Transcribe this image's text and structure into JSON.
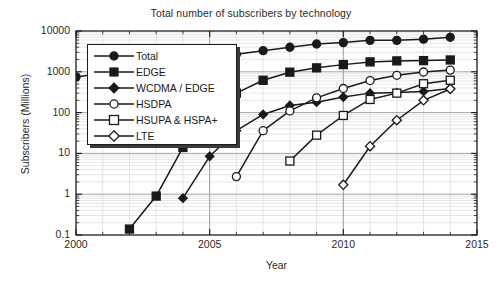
{
  "chart_data": {
    "type": "line",
    "title": "Total number of subscribers by technology",
    "xlabel": "Year",
    "ylabel": "Subscribers (Millions)",
    "xlim": [
      2000,
      2015
    ],
    "ylim": [
      0.1,
      10000
    ],
    "yscale": "log",
    "grid": true,
    "legend_position": "upper left",
    "xticks": [
      "2000",
      "2005",
      "2010",
      "2015"
    ],
    "yticks": [
      "0.1",
      "1",
      "10",
      "100",
      "1000",
      "10000"
    ],
    "series": [
      {
        "name": "Total",
        "marker": "filled-circle",
        "points": [
          {
            "x": 2000,
            "y": 750
          },
          {
            "x": 2006,
            "y": 2700
          },
          {
            "x": 2007,
            "y": 3300
          },
          {
            "x": 2008,
            "y": 4000
          },
          {
            "x": 2009,
            "y": 4800
          },
          {
            "x": 2010,
            "y": 5200
          },
          {
            "x": 2011,
            "y": 5900
          },
          {
            "x": 2012,
            "y": 5900
          },
          {
            "x": 2013,
            "y": 6300
          },
          {
            "x": 2014,
            "y": 7000
          }
        ]
      },
      {
        "name": "EDGE",
        "marker": "filled-square",
        "points": [
          {
            "x": 2002,
            "y": 0.14
          },
          {
            "x": 2003,
            "y": 0.9
          },
          {
            "x": 2004,
            "y": 14
          },
          {
            "x": 2006,
            "y": 300
          },
          {
            "x": 2007,
            "y": 620
          },
          {
            "x": 2008,
            "y": 980
          },
          {
            "x": 2009,
            "y": 1250
          },
          {
            "x": 2010,
            "y": 1500
          },
          {
            "x": 2011,
            "y": 1750
          },
          {
            "x": 2012,
            "y": 1850
          },
          {
            "x": 2013,
            "y": 1880
          },
          {
            "x": 2014,
            "y": 1950
          }
        ]
      },
      {
        "name": "WCDMA / EDGE",
        "marker": "filled-diamond",
        "points": [
          {
            "x": 2004,
            "y": 0.8
          },
          {
            "x": 2005,
            "y": 8.5
          },
          {
            "x": 2006,
            "y": 36
          },
          {
            "x": 2007,
            "y": 90
          },
          {
            "x": 2008,
            "y": 150
          },
          {
            "x": 2009,
            "y": 180
          },
          {
            "x": 2010,
            "y": 240
          },
          {
            "x": 2011,
            "y": 300
          },
          {
            "x": 2012,
            "y": 310
          },
          {
            "x": 2013,
            "y": 330
          },
          {
            "x": 2014,
            "y": 390
          }
        ]
      },
      {
        "name": "HSDPA",
        "marker": "open-circle",
        "points": [
          {
            "x": 2006,
            "y": 2.7
          },
          {
            "x": 2007,
            "y": 36
          },
          {
            "x": 2008,
            "y": 110
          },
          {
            "x": 2009,
            "y": 230
          },
          {
            "x": 2010,
            "y": 390
          },
          {
            "x": 2011,
            "y": 610
          },
          {
            "x": 2012,
            "y": 820
          },
          {
            "x": 2013,
            "y": 990
          },
          {
            "x": 2014,
            "y": 1100
          }
        ]
      },
      {
        "name": "HSUPA & HSPA+",
        "marker": "open-square",
        "points": [
          {
            "x": 2008,
            "y": 6.5
          },
          {
            "x": 2009,
            "y": 28
          },
          {
            "x": 2010,
            "y": 85
          },
          {
            "x": 2011,
            "y": 210
          },
          {
            "x": 2012,
            "y": 300
          },
          {
            "x": 2013,
            "y": 510
          },
          {
            "x": 2014,
            "y": 620
          }
        ]
      },
      {
        "name": "LTE",
        "marker": "open-diamond",
        "points": [
          {
            "x": 2010,
            "y": 1.7
          },
          {
            "x": 2011,
            "y": 15
          },
          {
            "x": 2012,
            "y": 65
          },
          {
            "x": 2013,
            "y": 200
          },
          {
            "x": 2014,
            "y": 380
          }
        ]
      }
    ]
  },
  "legend": {
    "items": [
      {
        "label": "Total"
      },
      {
        "label": "EDGE"
      },
      {
        "label": "WCDMA / EDGE"
      },
      {
        "label": "HSDPA"
      },
      {
        "label": "HSUPA & HSPA+"
      },
      {
        "label": "LTE"
      }
    ]
  },
  "colors": {
    "line": "#1a1a1a",
    "grid_major": "#9a9a9a",
    "grid_minor": "#cccccc",
    "axis": "#1a1a1a",
    "background": "#ffffff"
  }
}
